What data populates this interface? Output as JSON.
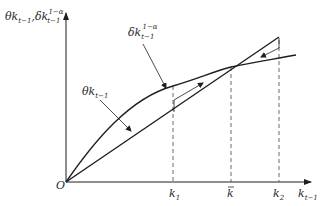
{
  "figure": {
    "type": "phase-diagram"
  },
  "axes": {
    "y_label_main1": "θk",
    "y_label_sub1": "t−1",
    "y_label_sep": ",",
    "y_label_main2": "δk",
    "y_label_sub2": "t−1",
    "y_label_sup2": "1−α",
    "x_label_main": "k",
    "x_label_sub": "t−1",
    "origin_label": "O"
  },
  "curves": {
    "concave": {
      "label_main": "δk",
      "label_sub": "t−1",
      "label_sup": "1−α"
    },
    "linear": {
      "label_main": "θk",
      "label_sub": "t−1"
    }
  },
  "x_ticks": [
    {
      "main": "k",
      "sub": "1",
      "bar": false
    },
    {
      "main": "k",
      "sub": "",
      "bar": true
    },
    {
      "main": "k",
      "sub": "2",
      "bar": false
    }
  ],
  "colors": {
    "line": "#1e1e1e",
    "dash": "#444444",
    "text": "#2a2a2a"
  }
}
